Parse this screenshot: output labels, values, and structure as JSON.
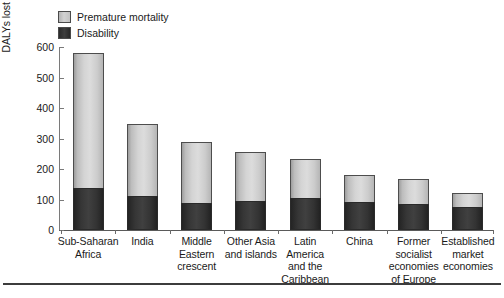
{
  "chart_data": {
    "type": "bar",
    "stacked": true,
    "title": "",
    "xlabel": "",
    "ylabel": "DALYs lost per 1,000 population",
    "ylim": [
      0,
      600
    ],
    "yticks": [
      0,
      100,
      200,
      300,
      400,
      500,
      600
    ],
    "ytick_labels": [
      "0",
      "100",
      "200",
      "300",
      "400",
      "500",
      "600"
    ],
    "grid": false,
    "legend_position": "top-left",
    "categories": [
      "Sub-Saharan\nAfrica",
      "India",
      "Middle\nEastern\ncrescent",
      "Other Asia\nand islands",
      "Latin\nAmerica\nand the\nCaribbean",
      "China",
      "Former\nsocialist\neconomies\nof Europe",
      "Established\nmarket\neconomies"
    ],
    "series": [
      {
        "name": "Disability",
        "color": "#333333",
        "values": [
          139,
          113,
          88,
          96,
          106,
          93,
          84,
          74
        ]
      },
      {
        "name": "Premature mortality",
        "color": "#cccccc",
        "values": [
          441,
          235,
          199,
          159,
          126,
          88,
          84,
          48
        ]
      }
    ],
    "totals": [
      580,
      348,
      287,
      255,
      232,
      181,
      168,
      122
    ]
  },
  "legend": {
    "items": [
      {
        "label": "Premature mortality",
        "swatch": "light-gray-swatch"
      },
      {
        "label": "Disability",
        "swatch": "dark-swatch"
      }
    ]
  },
  "axes": {
    "y_title": "DALYs lost per 1,000 population"
  }
}
